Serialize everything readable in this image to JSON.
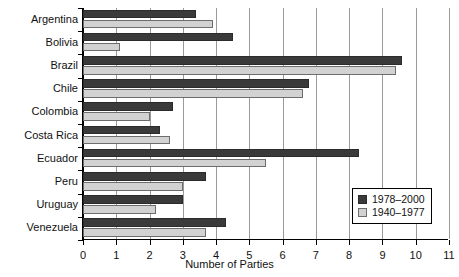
{
  "chart_data": {
    "type": "bar",
    "orientation": "horizontal",
    "title": "",
    "xlabel": "Number of Parties",
    "ylabel": "",
    "xlim": [
      0,
      11
    ],
    "xticks": [
      0,
      1,
      2,
      3,
      4,
      5,
      6,
      7,
      8,
      9,
      10,
      11
    ],
    "grid": true,
    "grid_axis": "x",
    "legend_position": "lower right",
    "categories": [
      "Argentina",
      "Bolivia",
      "Brazil",
      "Chile",
      "Colombia",
      "Costa Rica",
      "Ecuador",
      "Peru",
      "Uruguay",
      "Venezuela"
    ],
    "series": [
      {
        "name": "1978–2000",
        "color": "#3a3a3a",
        "values": [
          3.4,
          4.5,
          9.6,
          6.8,
          2.7,
          2.3,
          8.3,
          3.7,
          3.0,
          4.3
        ]
      },
      {
        "name": "1940–1977",
        "color": "#d2d2d2",
        "values": [
          3.9,
          1.1,
          9.4,
          6.6,
          2.0,
          2.6,
          5.5,
          3.0,
          2.2,
          3.7
        ]
      }
    ]
  },
  "axis": {
    "x_title": "Number of Parties",
    "x_tick_labels": [
      "0",
      "1",
      "2",
      "3",
      "4",
      "5",
      "6",
      "7",
      "8",
      "9",
      "10",
      "11"
    ],
    "y_tick_labels": [
      "Argentina",
      "Bolivia",
      "Brazil",
      "Chile",
      "Colombia",
      "Costa Rica",
      "Ecuador",
      "Peru",
      "Uruguay",
      "Venezuela"
    ]
  },
  "legend": {
    "entries": [
      {
        "label": "1978–2000",
        "color": "#3a3a3a"
      },
      {
        "label": "1940–1977",
        "color": "#d2d2d2"
      }
    ]
  }
}
